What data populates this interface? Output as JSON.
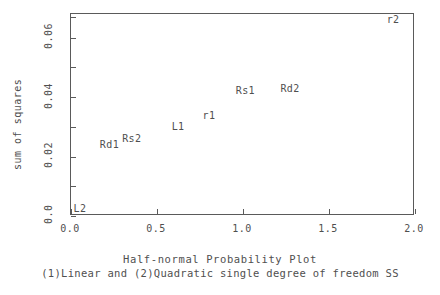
{
  "chart_data": {
    "type": "scatter",
    "title": "Half-normal Probability Plot",
    "subtitle": "(1)Linear and (2)Quadratic single degree of freedom SS",
    "xlabel": "",
    "ylabel": "sum of squares",
    "xlim": [
      0.0,
      2.0
    ],
    "ylim": [
      0.0,
      0.068
    ],
    "grid": false,
    "legend": "none",
    "marker_style": "text-label",
    "xticks": [
      "0.0",
      "0.5",
      "1.0",
      "1.5",
      "2.0"
    ],
    "xtick_values": [
      0.0,
      0.5,
      1.0,
      1.5,
      2.0
    ],
    "yticks": [
      "0.0",
      "0.02",
      "0.04",
      "0.06"
    ],
    "ytick_values": [
      0.0,
      0.02,
      0.04,
      0.06
    ],
    "yminor_values": [
      0.01,
      0.03,
      0.05,
      0.067
    ],
    "points": [
      {
        "label": "L2",
        "x": 0.05,
        "y": 0.0012
      },
      {
        "label": "Rd1",
        "x": 0.22,
        "y": 0.0238
      },
      {
        "label": "Rs2",
        "x": 0.35,
        "y": 0.0258
      },
      {
        "label": "L1",
        "x": 0.62,
        "y": 0.03
      },
      {
        "label": "r1",
        "x": 0.8,
        "y": 0.0338
      },
      {
        "label": "Rs1",
        "x": 1.01,
        "y": 0.042
      },
      {
        "label": "Rd2",
        "x": 1.27,
        "y": 0.0428
      },
      {
        "label": "r2",
        "x": 1.87,
        "y": 0.066
      }
    ]
  },
  "colors": {
    "axis": "#5a5a5a",
    "text": "#4f4f4f",
    "background": "#ffffff"
  }
}
